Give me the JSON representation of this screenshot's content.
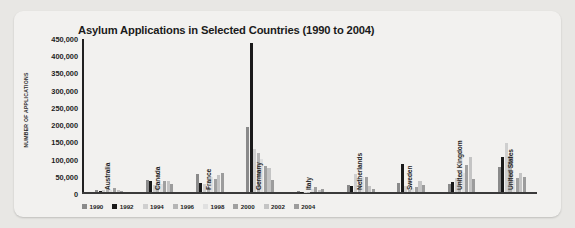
{
  "chart_data": {
    "type": "bar",
    "title": "Asylum Applications in Selected Countries (1990 to 2004)",
    "xlabel": "",
    "ylabel": "NUMBER OF APPLICATIONS",
    "ylim": [
      0,
      450000
    ],
    "ytick_labels": [
      "450,000",
      "400,000",
      "350,000",
      "300,000",
      "250,000",
      "200,000",
      "150,000",
      "100,000",
      "50,000",
      "0"
    ],
    "ytick_values": [
      450000,
      400000,
      350000,
      300000,
      250000,
      200000,
      150000,
      100000,
      50000,
      0
    ],
    "grid": false,
    "legend_position": "bottom",
    "categories": [
      "Australia",
      "Canada",
      "France",
      "Germany",
      "Italy",
      "Netherlands",
      "Sweden",
      "United Kingdom",
      "United States"
    ],
    "series": [
      {
        "name": "1990",
        "color": "#8a8a8a",
        "values": [
          6000,
          36000,
          54000,
          193000,
          4700,
          21000,
          29000,
          26000,
          74000
        ]
      },
      {
        "name": "1992",
        "color": "#1a1a1a",
        "values": [
          5000,
          34000,
          28000,
          438000,
          2500,
          20000,
          84000,
          32000,
          104000
        ]
      },
      {
        "name": "1994",
        "color": "#cfcfcf",
        "values": [
          6500,
          22000,
          26000,
          127000,
          1800,
          53000,
          19000,
          42000,
          144000
        ]
      },
      {
        "name": "1996",
        "color": "#b5b5b5",
        "values": [
          9500,
          26000,
          17000,
          116000,
          700,
          22000,
          5800,
          37000,
          107000
        ]
      },
      {
        "name": "1998",
        "color": "#e0e0e0",
        "values": [
          8200,
          24000,
          45000,
          99000,
          11000,
          45000,
          13000,
          58000,
          35000
        ]
      },
      {
        "name": "2000",
        "color": "#a0a0a0",
        "values": [
          13000,
          34000,
          39000,
          78000,
          15000,
          44000,
          16000,
          80000,
          41000
        ]
      },
      {
        "name": "2002",
        "color": "#c4c4c4",
        "values": [
          5900,
          33000,
          51000,
          71000,
          7300,
          18000,
          33000,
          103000,
          58000
        ]
      },
      {
        "name": "2004",
        "color": "#9c9c9c",
        "values": [
          3200,
          25000,
          58000,
          35000,
          9700,
          10000,
          23000,
          40000,
          45000
        ]
      }
    ]
  }
}
